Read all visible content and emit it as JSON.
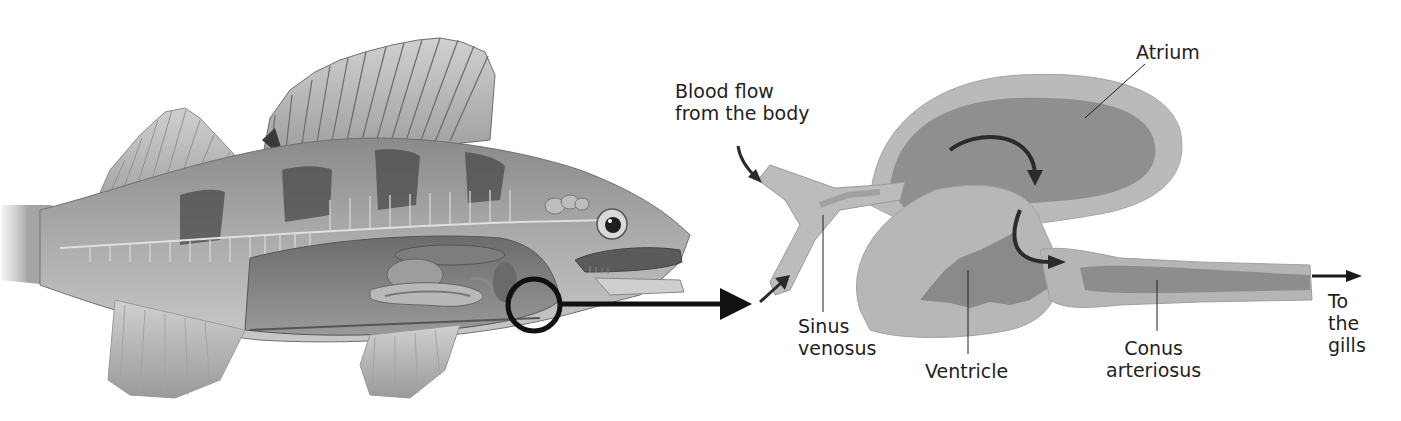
{
  "diagram": {
    "colors": {
      "background": "#ffffff",
      "text": "#231f20",
      "arrow": "#1a1a1a",
      "heart_wall": "#b9b9b9",
      "heart_inner": "#8e8e8e",
      "fish_body": "#9a9a9a",
      "fish_band": "#4a4a4a"
    },
    "labels": {
      "blood_flow": "Blood flow\nfrom the body",
      "atrium": "Atrium",
      "sinus_venosus": "Sinus\nvenosus",
      "ventricle": "Ventricle",
      "conus_arteriosus": "Conus\narteriosus",
      "to_gills": "To\nthe\ngills"
    },
    "callouts": [
      {
        "name": "heart-location",
        "shape": "circle",
        "description": "Circle marking heart position in fish, with arrow to enlarged view"
      }
    ],
    "flow_sequence": [
      "Blood flow from the body",
      "Sinus venosus",
      "Atrium",
      "Ventricle",
      "Conus arteriosus",
      "To the gills"
    ]
  }
}
